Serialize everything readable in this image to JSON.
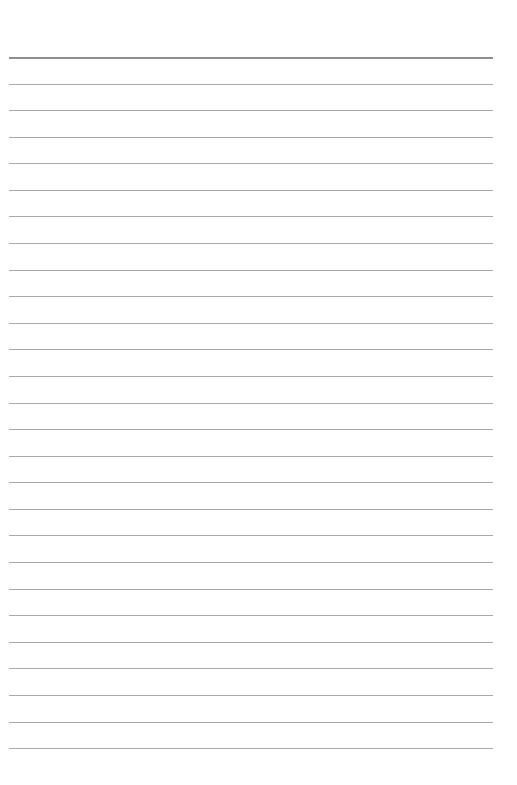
{
  "page": {
    "type": "lined-paper",
    "background_color": "#ffffff",
    "line_color": "#a9a9a9",
    "header_line_color": "#8e8e8e",
    "first_line_y": 57,
    "line_spacing": 26.58,
    "line_count": 27,
    "line_left": 9,
    "line_width": 484
  }
}
